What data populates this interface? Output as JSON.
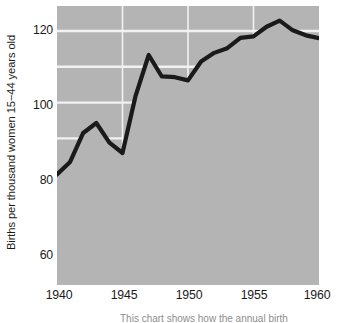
{
  "chart_data": {
    "type": "area",
    "title": "",
    "subtitle": "",
    "xlabel": "",
    "ylabel": "Births per thousand women 15−44 years old",
    "xlim": [
      1940,
      1960
    ],
    "ylim": [
      49,
      127
    ],
    "grid": true,
    "legend_position": "none",
    "x_ticks": [
      1940,
      1945,
      1950,
      1955,
      1960
    ],
    "x_tick_labels": [
      "1940",
      "1945",
      "1950",
      "1955",
      "1960"
    ],
    "y_ticks": [
      60,
      80,
      100,
      120
    ],
    "y_tick_labels": [
      "60",
      "80",
      "100",
      "120"
    ],
    "y_gridlines": [
      60,
      70,
      80,
      90,
      100,
      110,
      120
    ],
    "x_gridlines": [
      1945,
      1950,
      1955
    ],
    "series": [
      {
        "name": "Births per thousand women 15-44 years old",
        "x": [
          1940,
          1941,
          1942,
          1943,
          1944,
          1945,
          1946,
          1947,
          1948,
          1949,
          1950,
          1951,
          1952,
          1953,
          1954,
          1955,
          1956,
          1957,
          1958,
          1959,
          1960
        ],
        "values": [
          79.9,
          83.4,
          91.5,
          94.3,
          88.8,
          85.9,
          101.9,
          113.3,
          107.3,
          107.1,
          106.2,
          111.5,
          113.9,
          115.2,
          118.1,
          118.5,
          121.2,
          122.9,
          120.2,
          118.8,
          118.0
        ]
      }
    ],
    "colors": {
      "plot_background": "#b4b4b4",
      "grid_line": "#f2f2f2",
      "line": "#1a1a1a",
      "area_fill": "#b4b4b4",
      "text": "#1a1a1a",
      "page_background": "#ffffff"
    },
    "line_width_px": 4.2
  },
  "axes": {
    "y_title": "Births per thousand women 15−44 years old",
    "y_tick_labels": [
      "120",
      "100",
      "80",
      "60"
    ],
    "x_tick_labels": [
      "1940",
      "1945",
      "1950",
      "1955",
      "1960"
    ]
  },
  "caption": {
    "partial_text": "This chart shows how the annual birth"
  }
}
